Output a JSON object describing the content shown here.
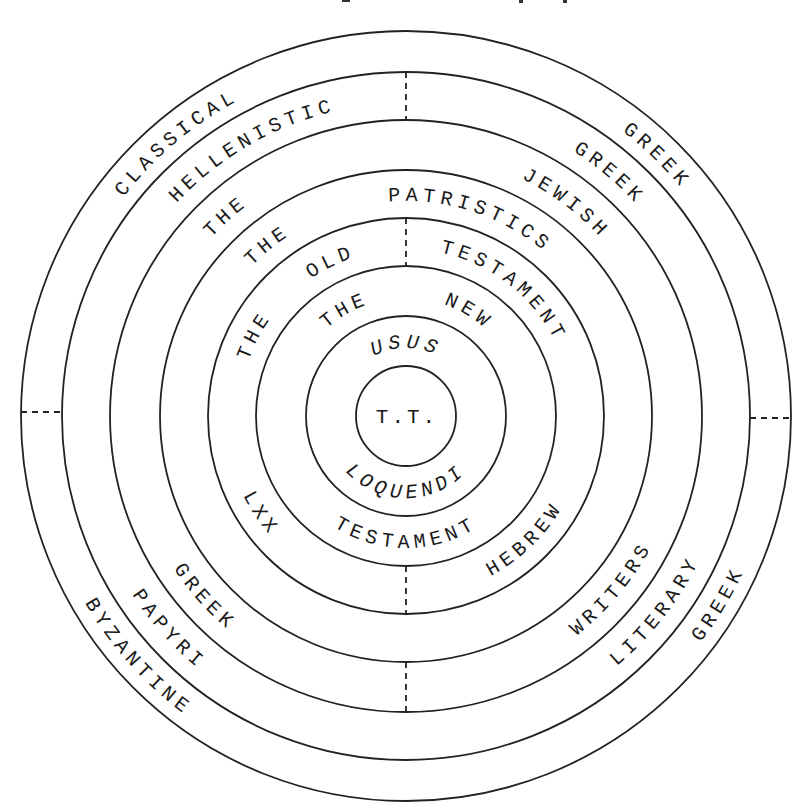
{
  "diagram": {
    "center_label": "T.T.",
    "center": [
      406,
      416
    ],
    "radii": [
      385,
      344,
      296,
      246,
      198,
      150,
      100,
      50
    ],
    "bands": [
      {
        "name": "band-1",
        "labels": [
          {
            "key": "classical",
            "text": "CLASSICAL",
            "angle": -40,
            "half": "top"
          },
          {
            "key": "greek_upper",
            "text": "GREEK",
            "angle": 44,
            "half": "top"
          },
          {
            "key": "byzantine",
            "text": "BYZANTINE",
            "angle": 228,
            "half": "bottom"
          },
          {
            "key": "greek_lower",
            "text": "GREEK",
            "angle": 121,
            "half": "bottom"
          }
        ]
      },
      {
        "name": "band-2",
        "labels": [
          {
            "key": "hellenistic",
            "text": "HELLENISTIC",
            "angle": -30,
            "half": "top"
          },
          {
            "key": "greek_upper",
            "text": "GREEK",
            "angle": 40,
            "half": "top"
          },
          {
            "key": "papyri",
            "text": "PAPYRI",
            "angle": 228,
            "half": "bottom"
          },
          {
            "key": "literary",
            "text": "LITERARY",
            "angle": 128,
            "half": "bottom"
          }
        ]
      },
      {
        "name": "band-3",
        "labels": [
          {
            "key": "the",
            "text": "THE",
            "angle": -42,
            "half": "top"
          },
          {
            "key": "jewish",
            "text": "JEWISH",
            "angle": 37,
            "half": "top"
          },
          {
            "key": "greek_lower",
            "text": "GREEK",
            "angle": 228,
            "half": "bottom"
          },
          {
            "key": "writers",
            "text": "WRITERS",
            "angle": 130,
            "half": "bottom"
          }
        ]
      },
      {
        "name": "band-4",
        "labels": [
          {
            "key": "the",
            "text": "THE",
            "angle": -39,
            "half": "top"
          },
          {
            "key": "patristics",
            "text": "PATRISTICS",
            "angle": 18,
            "half": "top"
          }
        ]
      },
      {
        "name": "band-5",
        "labels": [
          {
            "key": "the",
            "text": "THE",
            "angle": -62,
            "half": "top"
          },
          {
            "key": "old",
            "text": "OLD",
            "angle": -26,
            "half": "top"
          },
          {
            "key": "testament",
            "text": "TESTAMENT",
            "angle": 38,
            "half": "top"
          },
          {
            "key": "lxx",
            "text": "LXX",
            "angle": 236,
            "half": "bottom"
          },
          {
            "key": "hebrew",
            "text": "HEBREW",
            "angle": 136,
            "half": "bottom"
          }
        ]
      },
      {
        "name": "band-6",
        "labels": [
          {
            "key": "the",
            "text": "THE",
            "angle": -30,
            "half": "top"
          },
          {
            "key": "new",
            "text": "NEW",
            "angle": 31,
            "half": "top"
          },
          {
            "key": "testament",
            "text": "TESTAMENT",
            "angle": 180,
            "half": "bottom"
          }
        ]
      },
      {
        "name": "band-7",
        "labels": [
          {
            "key": "usus",
            "text": "USUS",
            "angle": 0,
            "half": "top",
            "italic": true
          },
          {
            "key": "loquendi",
            "text": "LOQUENDI",
            "angle": 180,
            "half": "bottom",
            "italic": true
          }
        ]
      }
    ],
    "dividers": [
      {
        "position": "top",
        "between": [
          "band-2"
        ]
      },
      {
        "position": "top",
        "between": [
          "band-5"
        ]
      },
      {
        "position": "left",
        "between": [
          "band-1"
        ]
      },
      {
        "position": "right",
        "between": [
          "band-1"
        ]
      },
      {
        "position": "bottom",
        "between": [
          "band-3"
        ]
      },
      {
        "position": "bottom",
        "between": [
          "band-5"
        ]
      }
    ]
  }
}
